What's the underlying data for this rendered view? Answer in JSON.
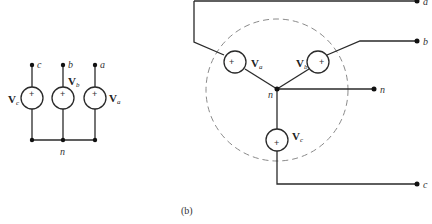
{
  "figure": {
    "caption": "(b)",
    "left_circuit": {
      "terminals": [
        "c",
        "b",
        "a"
      ],
      "sources": [
        {
          "name": "V",
          "subscript": "c",
          "polarity": "+"
        },
        {
          "name": "V",
          "subscript": "b",
          "polarity": "+"
        },
        {
          "name": "V",
          "subscript": "a",
          "polarity": "+"
        }
      ],
      "common_node": "n"
    },
    "right_circuit": {
      "terminals": [
        "a",
        "b",
        "n",
        "c"
      ],
      "sources": [
        {
          "name": "V",
          "subscript": "a",
          "polarity": "+"
        },
        {
          "name": "V",
          "subscript": "b",
          "polarity": "+"
        },
        {
          "name": "V",
          "subscript": "c",
          "polarity": "+"
        }
      ],
      "center_node": "n",
      "enclosure": "dashed-circle"
    }
  }
}
